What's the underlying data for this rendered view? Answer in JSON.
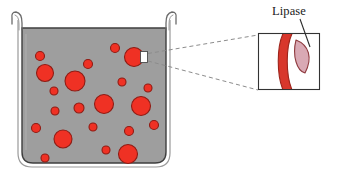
{
  "figure": {
    "canvas": {
      "width": 337,
      "height": 183,
      "background": "#ffffff"
    }
  },
  "labels": {
    "lipase": "Lipase"
  },
  "colors": {
    "beaker_fill": "#9e9e9e",
    "beaker_outline": "#3a3a3a",
    "beaker_glass_line": "#8a8a8a",
    "droplet_fill": "#ef3124",
    "droplet_outline": "#8f1c14",
    "inset_background": "#ffffff",
    "inset_border": "#333333",
    "membrane_band": "#d8372c",
    "membrane_outline": "#9d241b",
    "lipase_fill": "#d9a9b4",
    "lipase_outline": "#8f3b3f",
    "callout_line": "#8c8c8c",
    "leader_line": "#2b2b2b",
    "marker_fill": "#ffffff",
    "text": "#1a1a1a"
  },
  "beaker": {
    "name": "beaker",
    "x": 20,
    "y": 22,
    "width": 148,
    "height": 145,
    "corner_radius": 12,
    "rim_flare": "outward-curled lip on both top edges"
  },
  "droplets": [
    {
      "cx": 40,
      "cy": 56,
      "r": 4.5
    },
    {
      "cx": 45,
      "cy": 73,
      "r": 8.5
    },
    {
      "cx": 54,
      "cy": 91,
      "r": 4.0
    },
    {
      "cx": 75,
      "cy": 81,
      "r": 10.0
    },
    {
      "cx": 88,
      "cy": 64,
      "r": 4.5
    },
    {
      "cx": 115,
      "cy": 48,
      "r": 4.5
    },
    {
      "cx": 122,
      "cy": 82,
      "r": 4.0
    },
    {
      "cx": 148,
      "cy": 88,
      "r": 4.0
    },
    {
      "cx": 104,
      "cy": 104,
      "r": 9.5
    },
    {
      "cx": 141,
      "cy": 106,
      "r": 9.5
    },
    {
      "cx": 55,
      "cy": 111,
      "r": 4.0
    },
    {
      "cx": 79,
      "cy": 108,
      "r": 5.0
    },
    {
      "cx": 36,
      "cy": 128,
      "r": 4.5
    },
    {
      "cx": 93,
      "cy": 127,
      "r": 4.0
    },
    {
      "cx": 154,
      "cy": 125,
      "r": 4.5
    },
    {
      "cx": 63,
      "cy": 139,
      "r": 9.0
    },
    {
      "cx": 129,
      "cy": 131,
      "r": 4.5
    },
    {
      "cx": 45,
      "cy": 158,
      "r": 4.0
    },
    {
      "cx": 106,
      "cy": 150,
      "r": 4.0
    },
    {
      "cx": 128,
      "cy": 154,
      "r": 9.5
    }
  ],
  "highlighted_droplet": {
    "name": "magnified-droplet",
    "cx": 134,
    "cy": 57,
    "r": 9.5,
    "marker": {
      "x": 141,
      "y": 52,
      "width": 7,
      "height": 10
    }
  },
  "callout": {
    "from": {
      "x": 148,
      "y": 53
    },
    "to_top": {
      "x": 258,
      "y": 36
    },
    "from_lower": {
      "x": 148,
      "y": 61
    },
    "to_bottom": {
      "x": 258,
      "y": 90
    },
    "style": "dashed"
  },
  "inset": {
    "name": "magnified-view",
    "x": 258,
    "y": 33,
    "width": 62,
    "height": 57,
    "contents": {
      "membrane": "red curved droplet surface band",
      "enzyme": "lipase molecule bound to droplet surface"
    }
  },
  "leader": {
    "from": {
      "x": 302,
      "y": 20
    },
    "to": {
      "x": 311,
      "y": 49
    }
  }
}
